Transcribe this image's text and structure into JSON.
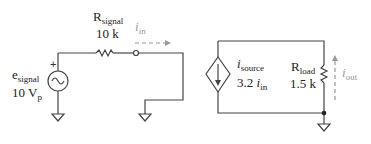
{
  "input_circuit": {
    "source": {
      "name": "e",
      "name_sub": "signal",
      "value": "10 V",
      "value_sub": "p",
      "polarity": "+"
    },
    "resistor": {
      "name": "R",
      "name_sub": "signal",
      "value": "10 k"
    },
    "current": {
      "name": "i",
      "name_sub": "in"
    }
  },
  "output_circuit": {
    "dependent_source": {
      "name": "i",
      "name_sub": "source",
      "gain": "3.2",
      "ctrl": "i",
      "ctrl_sub": "in"
    },
    "resistor": {
      "name": "R",
      "name_sub": "load",
      "value": "1.5 k"
    },
    "current": {
      "name": "i",
      "name_sub": "out"
    }
  },
  "colors": {
    "wire": "#444444",
    "current_arrow": "#999999"
  }
}
